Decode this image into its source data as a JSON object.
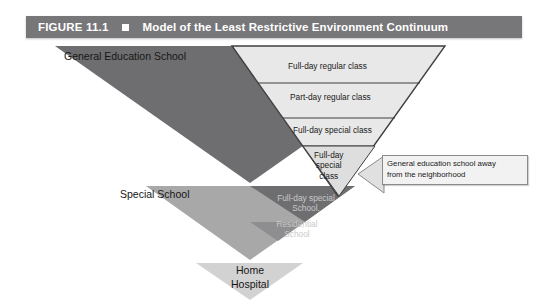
{
  "header": {
    "figure_number": "FIGURE 11.1",
    "bullet_icon": "square-bullet-icon",
    "title": "Model of the Least Restrictive Environment Continuum",
    "background_color": "#77777a",
    "text_color": "#ffffff"
  },
  "diagram": {
    "type": "inverted-triangle-continuum",
    "tiers": [
      {
        "id": "general-education-school",
        "label": "General Education School",
        "color": "#6e6e70"
      },
      {
        "id": "special-school",
        "label": "Special School",
        "color": "#a8a8a8"
      },
      {
        "id": "home-hospital",
        "label": "Home\nHospital",
        "label_line1": "Home",
        "label_line2": "Hospital",
        "color": "#d2d2d2"
      }
    ],
    "inner_rows": [
      {
        "id": "full-day-regular-class",
        "label": "Full-day regular class"
      },
      {
        "id": "part-day-regular-class",
        "label": "Part-day regular class"
      },
      {
        "id": "full-day-special-class",
        "label": "Full-day special class"
      },
      {
        "id": "full-day-special-class-separate",
        "label": "Full-day special class",
        "line1": "Full-day",
        "line2": "special",
        "line3": "class"
      }
    ],
    "faint_rows": [
      {
        "id": "full-day-special-school",
        "label": "Full-day special School",
        "line1": "Full-day special",
        "line2": "School."
      },
      {
        "id": "residential-school",
        "label": "Residential School",
        "line1": "Residential",
        "line2": "School"
      }
    ],
    "callout": {
      "id": "general-education-school-away-callout",
      "text": "General education school away from the neighborhood",
      "line1": "General education school away",
      "line2": "from the neighborhood",
      "pointer_direction": "left"
    },
    "colors": {
      "tier_dark": "#6e6e70",
      "tier_mid": "#a8a8a8",
      "tier_light": "#d2d2d2",
      "inner_panel": "#e8e8e8",
      "inner_panel_alt": "#dedede",
      "inner_inner": "#c9c9c9",
      "outline": "#4a4a4a",
      "callout_fill": "#f2f2f2",
      "callout_border": "#8a8a8a"
    }
  }
}
